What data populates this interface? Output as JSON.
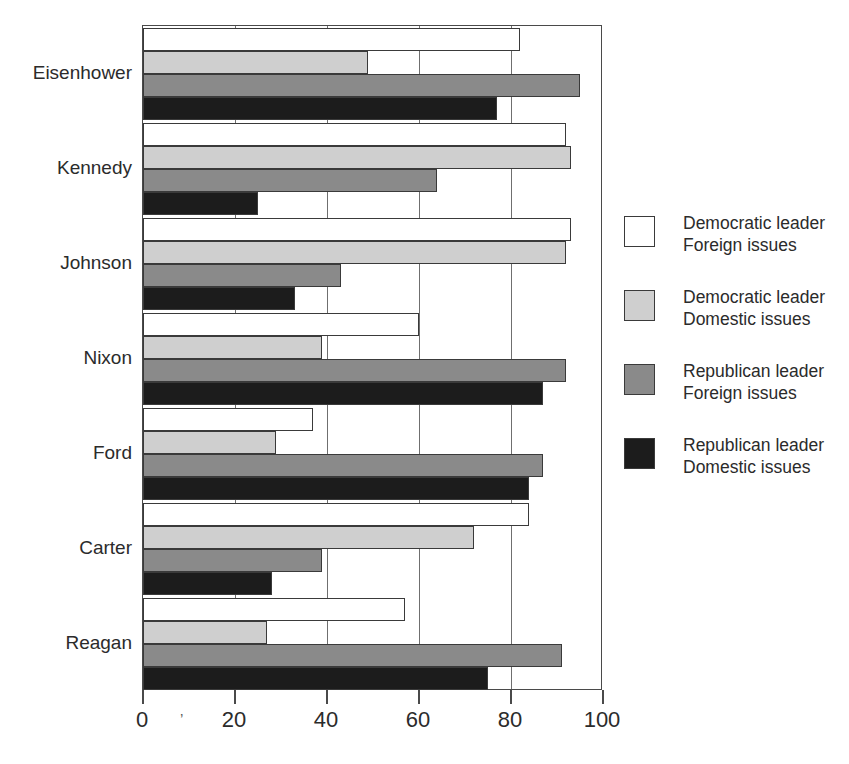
{
  "chart_data": {
    "type": "bar",
    "orientation": "horizontal",
    "title": "",
    "xlabel": "",
    "ylabel": "",
    "xlim": [
      0,
      100
    ],
    "xticks": [
      0,
      20,
      40,
      60,
      80,
      100
    ],
    "xtick_labels": [
      "0",
      "20",
      "40",
      "60",
      "80",
      "100"
    ],
    "grid": true,
    "grid_axis": "x",
    "legend_position": "right",
    "categories": [
      "Eisenhower",
      "Kennedy",
      "Johnson",
      "Nixon",
      "Ford",
      "Carter",
      "Reagan"
    ],
    "series": [
      {
        "name": "Democratic leader Foreign issues",
        "label_line1": "Democratic leader",
        "label_line2": "Foreign issues",
        "color": "#ffffff",
        "values": [
          82,
          92,
          93,
          60,
          37,
          84,
          57
        ]
      },
      {
        "name": "Democratic leader Domestic issues",
        "label_line1": "Democratic leader",
        "label_line2": "Domestic issues",
        "color": "#cfcfcf",
        "values": [
          49,
          93,
          92,
          39,
          29,
          72,
          27
        ]
      },
      {
        "name": "Republican leader Foreign issues",
        "label_line1": "Republican leader",
        "label_line2": "Foreign issues",
        "color": "#8a8a8a",
        "values": [
          95,
          64,
          43,
          92,
          87,
          39,
          91
        ]
      },
      {
        "name": "Republican leader Domestic issues",
        "label_line1": "Republican leader",
        "label_line2": "Domestic issues",
        "color": "#1c1c1c",
        "values": [
          77,
          25,
          33,
          87,
          84,
          28,
          75
        ]
      }
    ]
  },
  "axis": {
    "stray_mark": "’"
  }
}
